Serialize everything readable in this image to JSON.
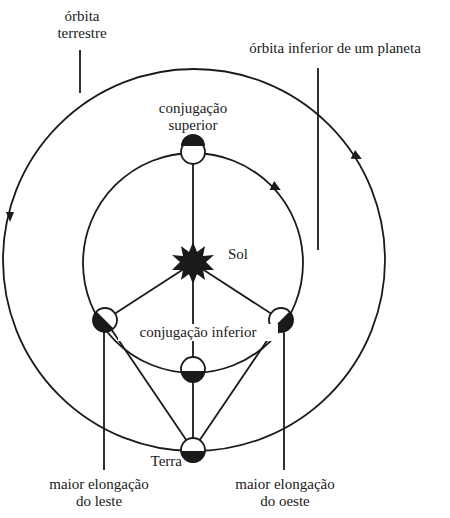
{
  "labels": {
    "earth_orbit": [
      "órbita",
      "terrestre"
    ],
    "inferior_orbit": "órbita inferior de um planeta",
    "superior_conjunction": [
      "conjugação",
      "superior"
    ],
    "sun": "Sol",
    "inferior_conjunction": "conjugação inferior",
    "earth": "Terra",
    "greatest_eastern_elongation": [
      "maior elongação",
      "do leste"
    ],
    "greatest_western_elongation": [
      "maior elongação",
      "do oeste"
    ]
  },
  "colors": {
    "ink": "#1a1a1a",
    "background": "#ffffff"
  }
}
